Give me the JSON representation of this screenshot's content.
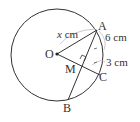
{
  "diagram": {
    "type": "circle-chord-geometry",
    "points": {
      "O": "O",
      "A": "A",
      "B": "B",
      "C": "C",
      "M": "M"
    },
    "measurements": {
      "OA": "x cm",
      "OA_var": "x",
      "OA_unit": " cm",
      "AC": "6 cm",
      "MC": "3 cm"
    },
    "colors": {
      "stroke": "#333333",
      "bracket": "#aaaaaa"
    }
  }
}
